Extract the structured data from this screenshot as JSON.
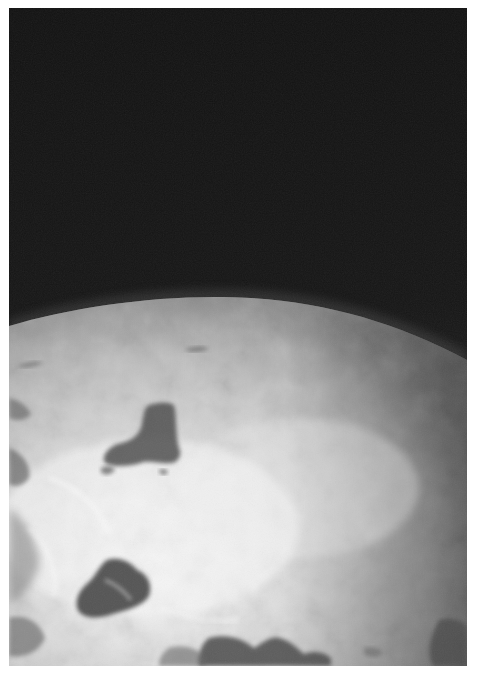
{
  "image": {
    "kind": "grayscale photograph",
    "alt": "Earth seen from orbit: curved horizon of a cloud-covered planet against black space, with dark landmasses breaking through the clouds",
    "colors": {
      "page_background": "#ffffff",
      "space": "#141414",
      "horizon_haze": "#6e6e6e",
      "cloud_bright": "#f2f2f2",
      "cloud_mid": "#c4c4c4",
      "land_dark": "#4a4a4a"
    }
  },
  "scene": {
    "sky": "black space",
    "planet": "Earth limb with thick cloud cover",
    "features": [
      "central triangular dark landmass",
      "dark landmass lower-left",
      "dark coastline along bottom edge",
      "dark region at bottom-right corner",
      "swirling cloud bands on left edge"
    ]
  }
}
